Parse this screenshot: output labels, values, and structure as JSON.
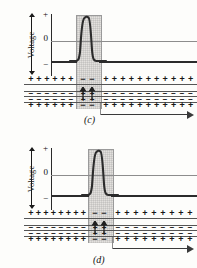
{
  "figure": {
    "background": "#fdfdfb"
  },
  "axis": {
    "label": "Voltage",
    "ticks": {
      "plus": "+",
      "zero": "0",
      "minus": "−"
    },
    "arrow_icon": "double-arrow-vertical-icon"
  },
  "charges": {
    "positive": "+",
    "negative": "−",
    "outer_resting": "+",
    "inner_resting": "−",
    "outer_excited": "−",
    "inner_excited": "+"
  },
  "colors": {
    "trace": "#2b2b2b",
    "zero_line": "#8d8d8d",
    "band_fill": "#e3e1de",
    "band_border": "#9a9a9a",
    "membrane_line": "#555555",
    "arrow": "#3a3a3a",
    "text": "#111111"
  },
  "panels": [
    {
      "id": "c",
      "caption": "(c)",
      "band": {
        "left": 76,
        "width": 24
      },
      "spike": {
        "left": 74,
        "width": 28,
        "peak_label": "+"
      },
      "resting_segments": [
        {
          "left": 51,
          "width": 25
        },
        {
          "left": 100,
          "width": 97
        }
      ],
      "propagation_arrow": {
        "left": 100,
        "width": 94,
        "direction": "right"
      },
      "outer_charge_counts": {
        "left": 6,
        "excited": 2,
        "right": 11
      },
      "inner_charge_counts": {
        "left": 6,
        "excited": 2,
        "right": 11
      }
    },
    {
      "id": "d",
      "caption": "(d)",
      "band": {
        "left": 88,
        "width": 24
      },
      "spike": {
        "left": 86,
        "width": 28,
        "peak_label": "+"
      },
      "resting_segments": [
        {
          "left": 51,
          "width": 37
        },
        {
          "left": 112,
          "width": 85
        }
      ],
      "propagation_arrow": {
        "left": 112,
        "width": 82,
        "direction": "right"
      },
      "outer_charge_counts": {
        "left": 8,
        "excited": 2,
        "right": 9
      },
      "inner_charge_counts": {
        "left": 8,
        "excited": 2,
        "right": 9
      }
    }
  ],
  "chart_data": {
    "type": "line",
    "xlabel": "",
    "ylabel": "Voltage",
    "ytick_labels": [
      "+",
      "0",
      "−"
    ],
    "ylim": [
      -1,
      1
    ],
    "grid": false,
    "legend": false,
    "series": [
      {
        "name": "(c) action potential",
        "x": [
          0,
          20,
          23,
          25,
          26,
          27,
          28,
          30,
          33,
          38,
          100
        ],
        "y": [
          -0.6,
          -0.6,
          -0.55,
          -0.1,
          0.72,
          0.85,
          0.72,
          -0.1,
          -0.55,
          -0.6,
          -0.6
        ]
      },
      {
        "name": "(d) action potential",
        "x": [
          0,
          30,
          33,
          35,
          36,
          37,
          38,
          40,
          43,
          48,
          100
        ],
        "y": [
          -0.6,
          -0.6,
          -0.55,
          -0.1,
          0.72,
          0.85,
          0.72,
          -0.1,
          -0.55,
          -0.6,
          -0.6
        ]
      }
    ],
    "annotations": [
      {
        "text": "(c)",
        "note": "depolarized region earlier along axon"
      },
      {
        "text": "(d)",
        "note": "depolarized region moved further right"
      }
    ]
  }
}
